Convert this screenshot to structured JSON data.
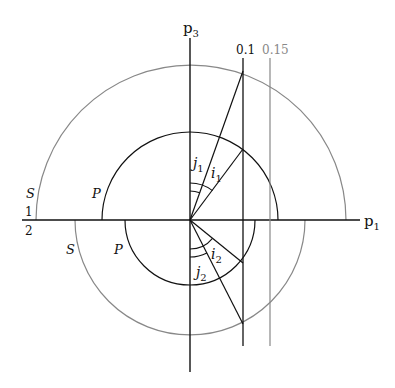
{
  "diagram": {
    "type": "slowness-surface-construction",
    "colors": {
      "primary": "#111111",
      "secondary": "#888888",
      "background": "#ffffff"
    },
    "origin": [
      190,
      220
    ],
    "axes": {
      "horizontal_label": "p",
      "horizontal_sub": "1",
      "vertical_label": "p",
      "vertical_sub": "3"
    },
    "media": {
      "upper_fraction_label": "1",
      "lower_fraction_label": "2"
    },
    "curves": {
      "upper_P_label": "P",
      "upper_S_label": "S",
      "lower_P_label": "P",
      "lower_S_label": "S"
    },
    "slowness_lines": [
      {
        "label": "0.1",
        "color": "#111111"
      },
      {
        "label": "0.15",
        "color": "#888888"
      }
    ],
    "angles": {
      "j1_label": "j",
      "j1_sub": "1",
      "i1_label": "i",
      "i1_sub": "1",
      "i2_label": "i",
      "i2_sub": "2",
      "j2_label": "j",
      "j2_sub": "2"
    }
  }
}
